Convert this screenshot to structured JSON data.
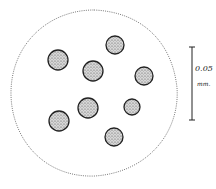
{
  "figure": {
    "colony_outline": {
      "cx": 94,
      "cy": 92,
      "rx": 84,
      "ry": 84,
      "style": "dotted"
    },
    "cells": [
      {
        "cx": 58,
        "cy": 60,
        "r": 10
      },
      {
        "cx": 115,
        "cy": 45,
        "r": 9
      },
      {
        "cx": 93,
        "cy": 71,
        "r": 10
      },
      {
        "cx": 144,
        "cy": 76,
        "r": 9
      },
      {
        "cx": 88,
        "cy": 108,
        "r": 10
      },
      {
        "cx": 132,
        "cy": 107,
        "r": 8
      },
      {
        "cx": 59,
        "cy": 121,
        "r": 10
      },
      {
        "cx": 114,
        "cy": 137,
        "r": 9
      }
    ],
    "scale_bar": {
      "value": "0.05",
      "unit": "mm."
    }
  }
}
